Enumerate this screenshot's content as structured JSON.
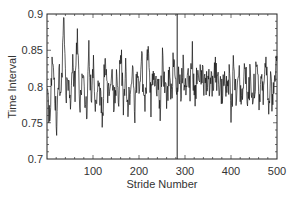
{
  "chart_data": {
    "type": "line",
    "title": "",
    "xlabel": "Stride Number",
    "ylabel": "Time Interval",
    "xlim": [
      0,
      500
    ],
    "ylim": [
      0.7,
      0.9
    ],
    "x_ticks": [
      100,
      200,
      300,
      400,
      500
    ],
    "x_tick_labels": [
      "100",
      "200",
      "300",
      "400",
      "500"
    ],
    "y_ticks": [
      0.7,
      0.75,
      0.8,
      0.85,
      0.9
    ],
    "y_tick_labels": [
      "0.7",
      "0.75",
      "0.8",
      "0.85",
      "0.9"
    ],
    "grid": false,
    "legend": null,
    "vertical_marker": {
      "x": 283,
      "label": ""
    },
    "series": [
      {
        "name": "stride interval",
        "color": "#111111",
        "x_step": 5,
        "x_start": 1,
        "values": [
          0.79,
          0.76,
          0.83,
          0.8,
          0.75,
          0.82,
          0.78,
          0.9,
          0.79,
          0.81,
          0.76,
          0.84,
          0.79,
          0.87,
          0.77,
          0.82,
          0.8,
          0.76,
          0.85,
          0.78,
          0.84,
          0.77,
          0.82,
          0.79,
          0.76,
          0.84,
          0.8,
          0.78,
          0.83,
          0.77,
          0.81,
          0.79,
          0.85,
          0.77,
          0.82,
          0.78,
          0.8,
          0.83,
          0.76,
          0.82,
          0.79,
          0.84,
          0.77,
          0.81,
          0.86,
          0.78,
          0.83,
          0.79,
          0.82,
          0.77,
          0.84,
          0.8,
          0.78,
          0.82,
          0.79,
          0.85,
          0.78,
          0.81,
          0.8,
          0.83,
          0.79,
          0.82,
          0.8,
          0.84,
          0.78,
          0.81,
          0.8,
          0.83,
          0.79,
          0.81,
          0.8,
          0.82,
          0.79,
          0.83,
          0.8,
          0.81,
          0.79,
          0.82,
          0.8,
          0.81,
          0.76,
          0.84,
          0.78,
          0.82,
          0.79,
          0.8,
          0.83,
          0.77,
          0.81,
          0.79,
          0.8,
          0.82,
          0.78,
          0.81,
          0.79,
          0.83,
          0.77,
          0.8,
          0.78,
          0.82
        ]
      }
    ],
    "series_detail_points": 500
  }
}
